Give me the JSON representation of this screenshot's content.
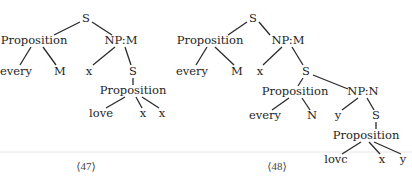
{
  "figure": {
    "trees": [
      {
        "id": "tree-47",
        "caption": "⟨47⟩",
        "caption_pos": [
          86,
          166
        ],
        "nodes": [
          {
            "id": "a0",
            "label": "S",
            "x": 86,
            "y": 19
          },
          {
            "id": "a1",
            "label": "Proposition",
            "x": 34,
            "y": 41
          },
          {
            "id": "a2",
            "label": "NP:M",
            "x": 121,
            "y": 41
          },
          {
            "id": "a3",
            "label": "every",
            "x": 16,
            "y": 72
          },
          {
            "id": "a4",
            "label": "M",
            "x": 60,
            "y": 72
          },
          {
            "id": "a5",
            "label": "x",
            "x": 89,
            "y": 72
          },
          {
            "id": "a6",
            "label": "S",
            "x": 133,
            "y": 72
          },
          {
            "id": "a7",
            "label": "Proposition",
            "x": 133,
            "y": 91
          },
          {
            "id": "a8",
            "label": "love",
            "x": 101,
            "y": 114
          },
          {
            "id": "a9",
            "label": "x",
            "x": 143,
            "y": 114
          },
          {
            "id": "a10",
            "label": "x",
            "x": 162,
            "y": 114
          }
        ],
        "edges": [
          [
            [
              "a0"
            ],
            80,
            22,
            54,
            35
          ],
          [
            [
              "a0"
            ],
            92,
            22,
            112,
            35
          ],
          [
            [
              "a1"
            ],
            31,
            47,
            20,
            65
          ],
          [
            [
              "a1"
            ],
            43,
            47,
            56,
            65
          ],
          [
            [
              "a2"
            ],
            115,
            47,
            93,
            65
          ],
          [
            [
              "a2"
            ],
            125,
            47,
            131,
            65
          ],
          [
            [
              "a6"
            ],
            133,
            78,
            133,
            85
          ],
          [
            [
              "a7"
            ],
            125,
            97,
            106,
            108
          ],
          [
            [
              "a7"
            ],
            136,
            97,
            142,
            108
          ],
          [
            [
              "a7"
            ],
            142,
            97,
            159,
            108
          ]
        ]
      },
      {
        "id": "tree-48",
        "caption": "⟨48⟩",
        "caption_pos": [
          277,
          166
        ],
        "nodes": [
          {
            "id": "b0",
            "label": "S",
            "x": 253,
            "y": 19
          },
          {
            "id": "b1",
            "label": "Proposition",
            "x": 210,
            "y": 41
          },
          {
            "id": "b2",
            "label": "NP:M",
            "x": 288,
            "y": 41
          },
          {
            "id": "b3",
            "label": "every",
            "x": 192,
            "y": 72
          },
          {
            "id": "b4",
            "label": "M",
            "x": 237,
            "y": 72
          },
          {
            "id": "b5",
            "label": "x",
            "x": 260,
            "y": 72
          },
          {
            "id": "b6",
            "label": "S",
            "x": 306,
            "y": 72
          },
          {
            "id": "b7",
            "label": "Proposition",
            "x": 295,
            "y": 92
          },
          {
            "id": "b8",
            "label": "NP:N",
            "x": 363,
            "y": 92
          },
          {
            "id": "b9",
            "label": "every",
            "x": 265,
            "y": 116
          },
          {
            "id": "b10",
            "label": "N",
            "x": 312,
            "y": 116
          },
          {
            "id": "b11",
            "label": "y",
            "x": 338,
            "y": 116
          },
          {
            "id": "b12",
            "label": "S",
            "x": 376,
            "y": 116
          },
          {
            "id": "b13",
            "label": "Proposition",
            "x": 366,
            "y": 136
          },
          {
            "id": "b14",
            "label": "lovc",
            "x": 336,
            "y": 160
          },
          {
            "id": "b15",
            "label": "x",
            "x": 382,
            "y": 160
          },
          {
            "id": "b16",
            "label": "y",
            "x": 403,
            "y": 160
          }
        ],
        "edges": [
          [
            [
              "b0"
            ],
            247,
            22,
            228,
            35
          ],
          [
            [
              "b0"
            ],
            259,
            22,
            270,
            35
          ],
          [
            [
              "b1"
            ],
            207,
            47,
            196,
            65
          ],
          [
            [
              "b1"
            ],
            215,
            47,
            234,
            65
          ],
          [
            [
              "b2"
            ],
            282,
            47,
            263,
            65
          ],
          [
            [
              "b2"
            ],
            292,
            47,
            303,
            65
          ],
          [
            [
              "b6"
            ],
            303,
            78,
            298,
            86
          ],
          [
            [
              "b6"
            ],
            313,
            75,
            348,
            89
          ],
          [
            [
              "b7"
            ],
            289,
            98,
            272,
            110
          ],
          [
            [
              "b7"
            ],
            302,
            98,
            310,
            110
          ],
          [
            [
              "b8"
            ],
            358,
            98,
            342,
            110
          ],
          [
            [
              "b8"
            ],
            367,
            98,
            374,
            110
          ],
          [
            [
              "b12"
            ],
            376,
            122,
            376,
            129
          ],
          [
            [
              "b13"
            ],
            361,
            142,
            342,
            154
          ],
          [
            [
              "b13"
            ],
            369,
            142,
            380,
            154
          ],
          [
            [
              "b13"
            ],
            374,
            142,
            401,
            154
          ]
        ]
      }
    ],
    "separator": {
      "y": 152,
      "x1": 0,
      "x2": 412
    }
  }
}
